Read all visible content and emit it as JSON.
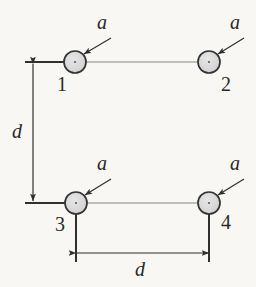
{
  "figure": {
    "type": "physics-diagram",
    "background_color": "#f8f7f4",
    "ink_color": "#2a2a2a",
    "particle_fill": "#d9d9d9",
    "particle_stroke": "#3a3a3a",
    "connector_color": "#a9a9a9",
    "dimension_color": "#2f2f2f"
  },
  "particles": [
    {
      "id": "p1",
      "label": "1",
      "accel_label": "a",
      "cx": 75,
      "cy": 62,
      "r": 11,
      "label_x": 57,
      "label_y": 74,
      "a_x": 97,
      "a_y": 12,
      "arrow_from_x": 111,
      "arrow_from_y": 38,
      "arrow_to_x": 84,
      "arrow_to_y": 54
    },
    {
      "id": "p2",
      "label": "2",
      "accel_label": "a",
      "cx": 209,
      "cy": 62,
      "r": 11,
      "label_x": 221,
      "label_y": 74,
      "a_x": 230,
      "a_y": 12,
      "arrow_from_x": 244,
      "arrow_from_y": 38,
      "arrow_to_x": 218,
      "arrow_to_y": 54
    },
    {
      "id": "p3",
      "label": "3",
      "accel_label": "a",
      "cx": 76,
      "cy": 203,
      "r": 11,
      "label_x": 55,
      "label_y": 214,
      "a_x": 97,
      "a_y": 153,
      "arrow_from_x": 111,
      "arrow_from_y": 179,
      "arrow_to_x": 85,
      "arrow_to_y": 195
    },
    {
      "id": "p4",
      "label": "4",
      "accel_label": "a",
      "cx": 209,
      "cy": 203,
      "r": 11,
      "label_x": 221,
      "label_y": 212,
      "a_x": 230,
      "a_y": 153,
      "arrow_from_x": 244,
      "arrow_from_y": 179,
      "arrow_to_x": 218,
      "arrow_to_y": 195
    }
  ],
  "connectors": [
    {
      "id": "top-rod",
      "x1": 86,
      "y1": 62,
      "x2": 198,
      "y2": 62
    },
    {
      "id": "bottom-rod",
      "x1": 87,
      "y1": 203,
      "x2": 198,
      "y2": 203
    }
  ],
  "extension_lines": [
    {
      "id": "ext-top-left",
      "x1": 25,
      "y1": 62,
      "x2": 66,
      "y2": 62
    },
    {
      "id": "ext-bottom-left",
      "x1": 25,
      "y1": 203,
      "x2": 66,
      "y2": 203
    },
    {
      "id": "ext-p3-down",
      "x1": 76,
      "y1": 214,
      "x2": 76,
      "y2": 262
    },
    {
      "id": "ext-p4-down",
      "x1": 209,
      "y1": 214,
      "x2": 209,
      "y2": 262
    }
  ],
  "dimensions": [
    {
      "id": "vertical-d",
      "label": "d",
      "orientation": "vertical",
      "x1": 33,
      "y1": 64,
      "x2": 33,
      "y2": 201,
      "label_x": 12,
      "label_y": 121
    },
    {
      "id": "horizontal-d",
      "label": "d",
      "orientation": "horizontal",
      "x1": 76,
      "y1": 253,
      "x2": 209,
      "y2": 253,
      "label_x": 135,
      "label_y": 259
    }
  ]
}
